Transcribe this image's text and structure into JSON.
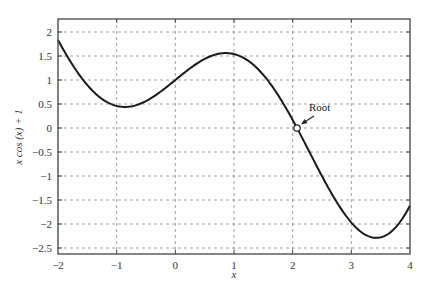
{
  "chart_data": {
    "type": "line",
    "title": "",
    "xlabel": "x",
    "ylabel": "x cos (x) + 1",
    "function": "x*cos(x)+1",
    "xlim": [
      -2,
      4
    ],
    "ylim": [
      -2.625,
      2.27
    ],
    "xticks": [
      -2,
      -1,
      0,
      1,
      2,
      3,
      4
    ],
    "xtick_labels": [
      "-2",
      "-1",
      "0",
      "1",
      "2",
      "3",
      "4"
    ],
    "yticks": [
      2,
      1.5,
      1,
      0.5,
      0,
      -0.5,
      -1,
      -1.5,
      -2,
      -2.5
    ],
    "ytick_labels": [
      "2",
      "1.5",
      "1",
      "0.5",
      "0",
      "-0.5",
      "-1",
      "-1.5",
      "-2",
      "-2.5"
    ],
    "grid": true,
    "grid_style": "dashed",
    "series": [
      {
        "name": "x cos (x) + 1",
        "x": [
          -2,
          -1.5,
          -1,
          -0.5,
          0,
          0.5,
          0.86,
          1,
          1.5,
          2,
          2.074,
          2.5,
          3,
          3.43,
          4
        ],
        "values": [
          1.83,
          0.89,
          0.46,
          0.56,
          1.0,
          1.44,
          1.56,
          1.54,
          1.11,
          0.17,
          0.0,
          -1.0,
          -1.97,
          -2.26,
          -1.61
        ],
        "color": "#1a1a1a"
      }
    ],
    "annotations": [
      {
        "text": "Root",
        "x": 2.074,
        "y": 0,
        "marker": "open-circle",
        "arrow": true
      }
    ],
    "legend": null
  },
  "colors": {
    "curve": "#1a1a1a",
    "grid": "#888888",
    "axes": "#444444"
  }
}
